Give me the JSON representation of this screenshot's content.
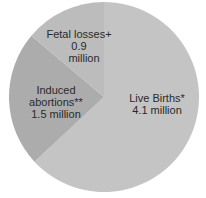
{
  "chart_data": {
    "type": "pie",
    "title": "",
    "categories": [
      "Live Births*",
      "Induced abortions**",
      "Fetal losses+"
    ],
    "values": [
      4.1,
      1.5,
      0.9
    ],
    "unit": "million",
    "start_angle": "12 o'clock, clockwise",
    "colors": [
      "#c4c4c4",
      "#acacac",
      "#bcbcbc"
    ],
    "labels": [
      {
        "name": "Live Births*",
        "value": "4.1 million"
      },
      {
        "name": "Induced abortions**",
        "value": "1.5 million"
      },
      {
        "name": "Fetal losses+",
        "value": "0.9",
        "value2": "million"
      }
    ]
  }
}
